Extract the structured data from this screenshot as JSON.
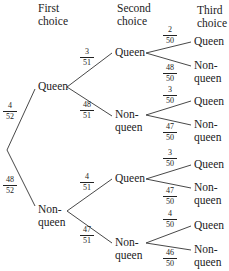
{
  "headers": {
    "first": [
      "First",
      "choice"
    ],
    "second": [
      "Second",
      "choice"
    ],
    "third": [
      "Third",
      "choice"
    ]
  },
  "level1": [
    {
      "label": [
        "Queen"
      ],
      "prob": {
        "num": "4",
        "den": "52"
      }
    },
    {
      "label": [
        "Non-",
        "queen"
      ],
      "prob": {
        "num": "48",
        "den": "52"
      }
    }
  ],
  "level2": [
    {
      "label": [
        "Queen"
      ],
      "prob": {
        "num": "3",
        "den": "51"
      }
    },
    {
      "label": [
        "Non-",
        "queen"
      ],
      "prob": {
        "num": "48",
        "den": "51"
      }
    },
    {
      "label": [
        "Queen"
      ],
      "prob": {
        "num": "4",
        "den": "51"
      }
    },
    {
      "label": [
        "Non-",
        "queen"
      ],
      "prob": {
        "num": "47",
        "den": "51"
      }
    }
  ],
  "level3": [
    {
      "label": [
        "Queen"
      ],
      "prob": {
        "num": "2",
        "den": "50"
      }
    },
    {
      "label": [
        "Non-",
        "queen"
      ],
      "prob": {
        "num": "48",
        "den": "50"
      }
    },
    {
      "label": [
        "Queen"
      ],
      "prob": {
        "num": "3",
        "den": "50"
      }
    },
    {
      "label": [
        "Non-",
        "queen"
      ],
      "prob": {
        "num": "47",
        "den": "50"
      }
    },
    {
      "label": [
        "Queen"
      ],
      "prob": {
        "num": "3",
        "den": "50"
      }
    },
    {
      "label": [
        "Non-",
        "queen"
      ],
      "prob": {
        "num": "47",
        "den": "50"
      }
    },
    {
      "label": [
        "Queen"
      ],
      "prob": {
        "num": "4",
        "den": "50"
      }
    },
    {
      "label": [
        "Non-",
        "queen"
      ],
      "prob": {
        "num": "46",
        "den": "50"
      }
    }
  ],
  "colors": {
    "line": "#333333",
    "text": "#222222",
    "background": "#ffffff"
  }
}
